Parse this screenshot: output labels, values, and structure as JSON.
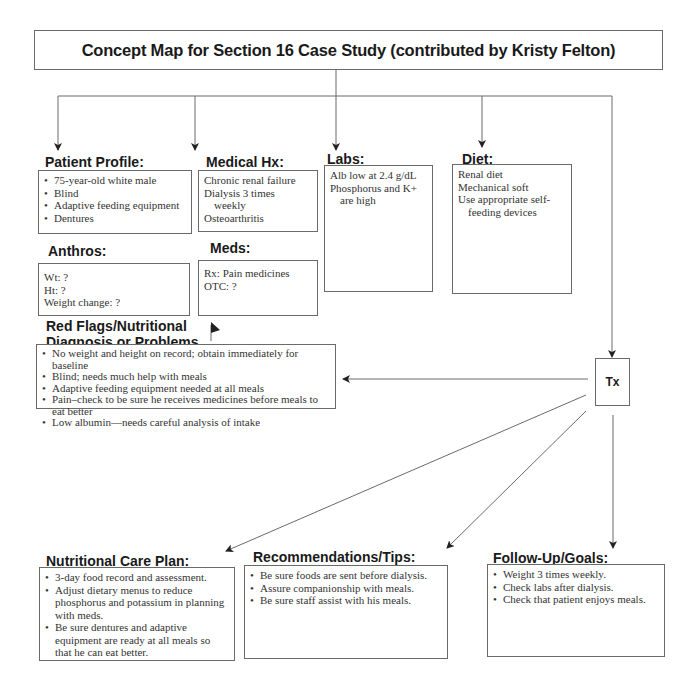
{
  "title": "Concept Map for Section 16 Case Study (contributed by Kristy Felton)",
  "nodes": {
    "patient_profile": {
      "heading": "Patient Profile:",
      "items": [
        "75-year-old white male",
        "Blind",
        "Adaptive feeding equipment",
        "Dentures"
      ]
    },
    "anthros": {
      "heading": "Anthros:",
      "lines": [
        "Wt: ?",
        "Ht: ?",
        "Weight change: ?"
      ]
    },
    "medical_hx": {
      "heading": "Medical Hx:",
      "lines": [
        "Chronic renal failure",
        "Dialysis 3 times",
        "weekly",
        "Osteoarthritis"
      ]
    },
    "meds": {
      "heading": "Meds:",
      "lines": [
        "Rx: Pain medicines",
        "OTC: ?"
      ]
    },
    "labs": {
      "heading": "Labs:",
      "lines": [
        "Alb low at 2.4 g/dL",
        "Phosphorus and K+",
        "are high"
      ]
    },
    "diet": {
      "heading": "Diet:",
      "lines": [
        "Renal diet",
        "Mechanical soft",
        "Use appropriate self-",
        "feeding devices"
      ]
    },
    "red_flags": {
      "heading_line1": "Red Flags/Nutritional",
      "heading_line2": "Diagnosis or Problems",
      "items": [
        "No weight and height on record; obtain immediately for baseline",
        "Blind; needs much help with meals",
        "Adaptive feeding equipment needed at all meals",
        "Pain–check to be sure he receives medicines before meals to eat better",
        "Low albumin—needs careful analysis of intake"
      ]
    },
    "tx": {
      "label": "Tx"
    },
    "care_plan": {
      "heading": "Nutritional Care Plan:",
      "items": [
        "3-day food record and assessment.",
        "Adjust dietary menus to reduce phosphorus and potassium in planning with meds.",
        "Be sure dentures and adaptive equipment are ready at all meals so that he can eat better."
      ]
    },
    "recommendations": {
      "heading": "Recommendations/Tips:",
      "items": [
        "Be sure foods are sent before dialysis.",
        "Assure companionship with meals.",
        "Be sure staff assist with his meals."
      ]
    },
    "follow_up": {
      "heading": "Follow-Up/Goals:",
      "items": [
        "Weight 3 times weekly.",
        "Check labs after dialysis.",
        "Check that patient enjoys meals."
      ]
    }
  },
  "colors": {
    "line": "#6a6a6a",
    "text": "#2a2a2a",
    "heading": "#1a1a1a"
  }
}
